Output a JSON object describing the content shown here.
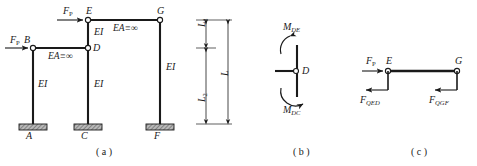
{
  "figure": {
    "panels": [
      {
        "id": "a",
        "caption": "( a )"
      },
      {
        "id": "b",
        "caption": "( b )"
      },
      {
        "id": "c",
        "caption": "( c )"
      }
    ],
    "colors": {
      "line": "#1a1a1a",
      "hatch": "#8c8c8c",
      "text": "#1a1a1a",
      "background": "#ffffff"
    }
  },
  "panel_a": {
    "joints": [
      {
        "name": "A",
        "label": "A",
        "type": "fixed-support"
      },
      {
        "name": "B",
        "label": "B",
        "type": "hinge"
      },
      {
        "name": "C",
        "label": "C",
        "type": "fixed-support"
      },
      {
        "name": "D",
        "label": "D",
        "type": "hinge"
      },
      {
        "name": "E",
        "label": "E",
        "type": "hinge"
      },
      {
        "name": "F",
        "label": "F",
        "type": "fixed-support"
      },
      {
        "name": "G",
        "label": "G",
        "type": "hinge"
      }
    ],
    "loads": [
      {
        "name": "load-at-E",
        "symbol": "F",
        "subscript": "P",
        "direction": "right"
      },
      {
        "name": "load-at-B",
        "symbol": "F",
        "subscript": "P",
        "direction": "right"
      }
    ],
    "member_labels": [
      {
        "name": "stiffness-EG",
        "text": "EA≡∞"
      },
      {
        "name": "stiffness-BD",
        "text": "EA≡∞"
      },
      {
        "name": "stiffness-DE",
        "text": "EI"
      },
      {
        "name": "stiffness-AB",
        "text": "EI"
      },
      {
        "name": "stiffness-CD",
        "text": "EI"
      },
      {
        "name": "stiffness-FG",
        "text": "EI"
      }
    ],
    "dimensions": [
      {
        "name": "dim-L1",
        "symbol": "L",
        "subscript": "1"
      },
      {
        "name": "dim-L2",
        "symbol": "L",
        "subscript": "2"
      },
      {
        "name": "dim-L",
        "symbol": "L",
        "subscript": ""
      }
    ]
  },
  "panel_b": {
    "joint_label": "D",
    "moments": [
      {
        "name": "moment-DE",
        "symbol": "M",
        "subscript": "DE",
        "position": "top"
      },
      {
        "name": "moment-DC",
        "symbol": "M",
        "subscript": "DC",
        "position": "bottom"
      }
    ]
  },
  "panel_c": {
    "joints": [
      {
        "name": "E",
        "label": "E"
      },
      {
        "name": "G",
        "label": "G"
      }
    ],
    "loads": [
      {
        "name": "load-FP",
        "symbol": "F",
        "subscript": "P",
        "direction": "right"
      }
    ],
    "shears": [
      {
        "name": "shear-QED",
        "symbol": "F",
        "subscript": "QED",
        "direction": "left"
      },
      {
        "name": "shear-QGF",
        "symbol": "F",
        "subscript": "QGF",
        "direction": "left"
      }
    ]
  }
}
